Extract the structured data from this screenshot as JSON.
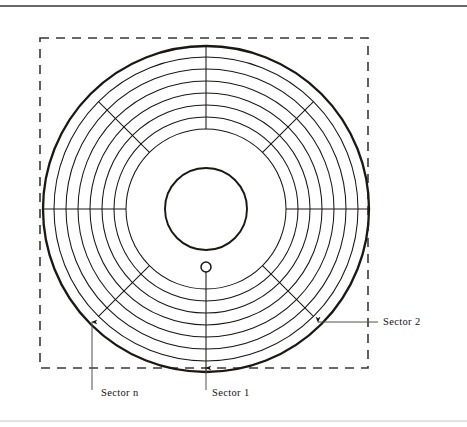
{
  "figure": {
    "kind": "magnetic-disk-sector-diagram",
    "title": "",
    "background_color": "#ffffff",
    "line_color": "#1a1714",
    "leader_color": "#55514d",
    "dashed_color": "#3a3632"
  },
  "rules": {
    "top_rule": {
      "visible": true,
      "y": 6,
      "x1": 0,
      "x2": 467,
      "color": "#3a3632"
    },
    "bottom_rule": {
      "visible": true,
      "y": 421,
      "x1": 0,
      "x2": 467,
      "color": "#c8c4c0"
    }
  },
  "jacket": {
    "name": "disk-jacket-outline",
    "shape": "dashed-square",
    "x": 40,
    "y": 38,
    "width": 328,
    "height": 330,
    "dash": "9 7",
    "stroke_width": 1.6
  },
  "disk": {
    "center_x": 206,
    "center_y": 209,
    "outer_radius": 163,
    "outer_stroke_width": 2.3,
    "hub_radius": 41,
    "hub_stroke_width": 1.9,
    "index_hole": {
      "name": "index-hole",
      "cx": 206,
      "cy": 267,
      "r": 5.0,
      "stroke_width": 1.5
    },
    "tracks": [
      {
        "index": 1,
        "radius": 152
      },
      {
        "index": 2,
        "radius": 140
      },
      {
        "index": 3,
        "radius": 128
      },
      {
        "index": 4,
        "radius": 116
      },
      {
        "index": 5,
        "radius": 104
      },
      {
        "index": 6,
        "radius": 92
      },
      {
        "index": 7,
        "radius": 80
      }
    ],
    "track_stroke_width": 1.05,
    "sector_count": 8,
    "sector_spokes": [
      {
        "index": 0,
        "angle_deg": 90,
        "label": "sector-boundary-top",
        "r_inner": 80,
        "r_outer": 163
      },
      {
        "index": 1,
        "angle_deg": 45,
        "label": "sector-boundary-upper-right",
        "r_inner": 80,
        "r_outer": 152
      },
      {
        "index": 2,
        "angle_deg": 0,
        "label": "sector-boundary-right",
        "r_inner": 80,
        "r_outer": 163
      },
      {
        "index": 3,
        "angle_deg": 315,
        "label": "sector-boundary-lower-right",
        "r_inner": 80,
        "r_outer": 152
      },
      {
        "index": 4,
        "angle_deg": 270,
        "label": "sector-boundary-bottom",
        "r_inner": 58,
        "r_outer": 163
      },
      {
        "index": 5,
        "angle_deg": 225,
        "label": "sector-boundary-lower-left",
        "r_inner": 80,
        "r_outer": 152
      },
      {
        "index": 6,
        "angle_deg": 180,
        "label": "sector-boundary-left",
        "r_inner": 80,
        "r_outer": 163
      },
      {
        "index": 7,
        "angle_deg": 135,
        "label": "sector-boundary-upper-left",
        "r_inner": 80,
        "r_outer": 152
      }
    ]
  },
  "annotations": [
    {
      "id": "sector-n",
      "text": "Sector n",
      "text_x": 101,
      "text_y": 396,
      "anchor": "start",
      "leader": {
        "type": "vertical-arrow-up",
        "x": 92,
        "y_start": 390,
        "y_end": 322
      }
    },
    {
      "id": "sector-1",
      "text": "Sector 1",
      "text_x": 212,
      "text_y": 396,
      "anchor": "start",
      "leader": {
        "type": "vertical-arrow-up",
        "x": 206,
        "y_start": 390,
        "y_end": 368
      }
    },
    {
      "id": "sector-2",
      "text": "Sector 2",
      "text_x": 383,
      "text_y": 325,
      "anchor": "start",
      "leader": {
        "type": "horizontal-arrow-left",
        "y": 322,
        "x_start": 378,
        "x_end": 318
      }
    }
  ]
}
